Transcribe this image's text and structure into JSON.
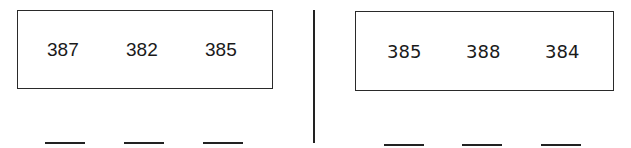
{
  "problems": [
    {
      "numbers": [
        "387",
        "382",
        "385"
      ],
      "answer_blanks": 3
    },
    {
      "numbers": [
        "385",
        "388",
        "384"
      ],
      "answer_blanks": 3
    }
  ]
}
